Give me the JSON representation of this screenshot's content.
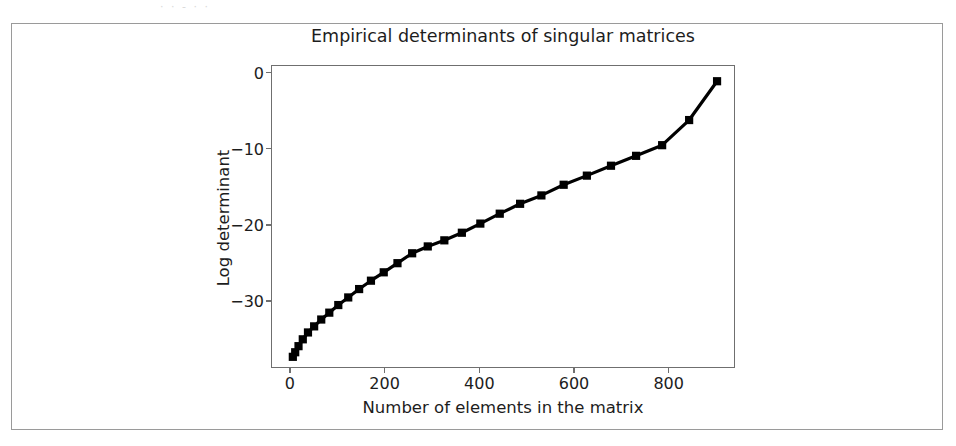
{
  "page": {
    "scan_artifact_text": "· ·        -        ·        ·"
  },
  "figure": {
    "title": "Empirical determinants of singular matrices",
    "xlabel": "Number of elements in the matrix",
    "ylabel": "Log determinant",
    "line_color": "#000000",
    "marker": "square",
    "frame_color": "#6f6f6f",
    "border_color": "#9a9a9a"
  },
  "chart_data": {
    "type": "line",
    "title": "Empirical determinants of singular matrices",
    "xlabel": "Number of elements in the matrix",
    "ylabel": "Log determinant",
    "xlim": [
      -40,
      940
    ],
    "ylim": [
      -38.8,
      1.0
    ],
    "xticks": [
      0,
      200,
      400,
      600,
      800
    ],
    "yticks": [
      0,
      -10,
      -20,
      -30
    ],
    "xtick_labels": [
      "0",
      "200",
      "400",
      "600",
      "800"
    ],
    "ytick_labels": [
      "0",
      "-10",
      "-20",
      "-30"
    ],
    "grid": false,
    "legend": null,
    "series": [
      {
        "name": "log determinant",
        "marker": "square",
        "color": "#000000",
        "x": [
          4,
          9,
          16,
          25,
          36,
          49,
          64,
          81,
          100,
          121,
          144,
          169,
          196,
          225,
          256,
          289,
          324,
          361,
          400,
          441,
          484,
          529,
          576,
          625,
          676,
          729,
          784,
          841,
          900
        ],
        "y": [
          -37.2,
          -36.6,
          -35.8,
          -34.9,
          -34.0,
          -33.2,
          -32.3,
          -31.4,
          -30.4,
          -29.4,
          -28.3,
          -27.2,
          -26.1,
          -24.9,
          -23.6,
          -22.7,
          -21.9,
          -20.9,
          -19.7,
          -18.4,
          -17.1,
          -16.0,
          -14.6,
          -13.4,
          -12.1,
          -10.8,
          -9.4,
          -6.1,
          -1.0
        ]
      }
    ]
  }
}
